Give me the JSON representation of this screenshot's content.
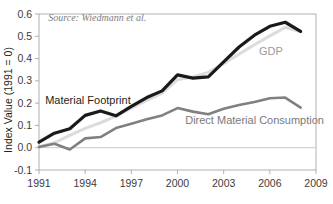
{
  "chart_data": {
    "type": "line",
    "title": "",
    "xlabel": "",
    "ylabel": "Index Value (1991 = 0)",
    "xlim": [
      1991,
      2009
    ],
    "ylim": [
      -0.1,
      0.6
    ],
    "grid": false,
    "legend_position": "inline-annotations",
    "x": [
      1991,
      1992,
      1993,
      1994,
      1995,
      1996,
      1997,
      1998,
      1999,
      2000,
      2001,
      2002,
      2003,
      2004,
      2005,
      2006,
      2007,
      2008
    ],
    "xticks": [
      "1991",
      "1994",
      "1997",
      "2000",
      "2003",
      "2006",
      "2009"
    ],
    "xtick_values": [
      1991,
      1994,
      1997,
      2000,
      2003,
      2006,
      2009
    ],
    "yticks": [
      "-0.1",
      "0.0",
      "0.1",
      "0.2",
      "0.3",
      "0.4",
      "0.5",
      "0.6"
    ],
    "ytick_values": [
      -0.1,
      0.0,
      0.1,
      0.2,
      0.3,
      0.4,
      0.5,
      0.6
    ],
    "series": [
      {
        "name": "Material Footprint",
        "color": "#1a1a1a",
        "width": 3.2,
        "label_color": "#231f20",
        "values": [
          0.025,
          0.065,
          0.085,
          0.145,
          0.165,
          0.143,
          0.185,
          0.225,
          0.255,
          0.327,
          0.312,
          0.318,
          0.385,
          0.452,
          0.505,
          0.545,
          0.563,
          0.522
        ]
      },
      {
        "name": "GDP",
        "color": "#dcdcdc",
        "width": 3.0,
        "label_color": "#9a9a9a",
        "values": [
          0.005,
          0.022,
          0.055,
          0.087,
          0.112,
          0.142,
          0.178,
          0.212,
          0.245,
          0.305,
          0.318,
          0.338,
          0.378,
          0.42,
          0.462,
          0.502,
          0.54,
          0.52
        ]
      },
      {
        "name": "Direct Material Consumption",
        "color": "#808080",
        "width": 2.6,
        "label_color": "#7a7a7a",
        "values": [
          0.003,
          0.018,
          -0.008,
          0.042,
          0.048,
          0.088,
          0.108,
          0.128,
          0.145,
          0.178,
          0.162,
          0.15,
          0.175,
          0.192,
          0.205,
          0.222,
          0.225,
          0.18
        ]
      }
    ],
    "annotations": [
      {
        "name": "source-note",
        "text": "Source: Wiedmann et al.",
        "x": 1991.6,
        "y": 0.567,
        "color": "#7d7d7d"
      },
      {
        "name": "material-footprint-label",
        "text": "Material Footprint",
        "x": 1991.4,
        "y": 0.197,
        "color": "#231f20"
      },
      {
        "name": "gdp-label",
        "text": "GDP",
        "x": 2005.3,
        "y": 0.418,
        "color": "#9a9a9a"
      },
      {
        "name": "dmc-label",
        "text": "Direct Material Consumption",
        "x": 2000.5,
        "y": 0.108,
        "color": "#7a7a7a"
      }
    ],
    "zero_line": {
      "value": 0.0,
      "color": "#c9c9c9"
    },
    "frame_color": "#b0b0b0",
    "background": "#ffffff"
  },
  "axes": {
    "y_axis_title": "Index Value (1991 = 0)"
  }
}
